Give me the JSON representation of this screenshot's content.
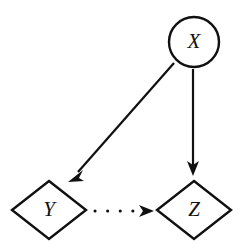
{
  "figure": {
    "kind": "causal-diagram",
    "background_color": "#ffffff",
    "stroke_color": "#101010",
    "width": 247,
    "height": 250
  },
  "nodes": {
    "x": {
      "label": "X",
      "shape": "circle",
      "cx": 194,
      "cy": 42,
      "r": 25,
      "icon": "circle-node-icon"
    },
    "y": {
      "label": "Y",
      "shape": "diamond",
      "cx": 49,
      "cy": 210,
      "rx": 37,
      "ry": 29,
      "icon": "diamond-node-icon"
    },
    "z": {
      "label": "Z",
      "shape": "diamond",
      "cx": 194,
      "cy": 210,
      "rx": 37,
      "ry": 29,
      "icon": "diamond-node-icon"
    }
  },
  "edges": [
    {
      "id": "x-to-y",
      "from": "X",
      "to": "Y",
      "style": "solid",
      "arrowhead": "filled-triangle",
      "x1": 174,
      "y1": 63,
      "x2": 70,
      "y2": 181
    },
    {
      "id": "x-to-z",
      "from": "X",
      "to": "Z",
      "style": "solid",
      "arrowhead": "filled-triangle",
      "x1": 193,
      "y1": 69,
      "x2": 193,
      "y2": 175
    },
    {
      "id": "y-to-z",
      "from": "Y",
      "to": "Z",
      "style": "dotted",
      "arrowhead": "filled-triangle",
      "x1": 95,
      "y1": 211,
      "x2": 154,
      "y2": 211,
      "dot_count": 4
    }
  ]
}
